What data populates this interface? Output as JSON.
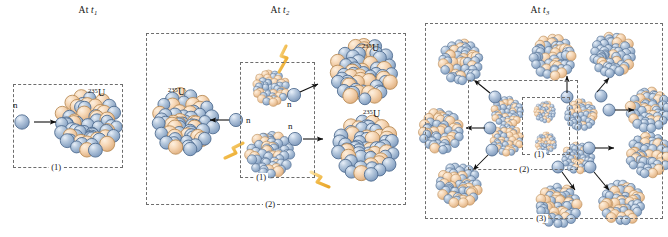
{
  "figure": {
    "width": 668,
    "height": 237,
    "background": "#ffffff"
  },
  "colors": {
    "nucleon_blue": "#a9bed9",
    "nucleon_blue_dark": "#6d88ad",
    "nucleon_peach": "#f6d7b6",
    "nucleon_peach_dark": "#d9a974",
    "neutron": "#aac0da",
    "neutron_dark": "#6f8bb0",
    "gamma": "#f0bb55",
    "gamma_light": "#f8dfa4",
    "outline": "#2b3a4d",
    "dash": "#6d6d6d",
    "arrow": "#101010",
    "text": "#141414"
  },
  "panels": [
    {
      "id": "panel-1",
      "title_prefix": "At ",
      "title_var": "t",
      "title_sub": "1",
      "boxes": [
        {
          "id": "box-1",
          "label": "(1)"
        }
      ],
      "nuclei": [
        {
          "id": "u235-p1",
          "label_sup": "235",
          "label_el": "U",
          "size": "large"
        }
      ],
      "neutrons": [
        {
          "id": "neutron-p1",
          "label": "n"
        }
      ],
      "gammas": []
    },
    {
      "id": "panel-2",
      "title_prefix": "At ",
      "title_var": "t",
      "title_sub": "2",
      "boxes": [
        {
          "id": "box-1",
          "label": "(1)"
        },
        {
          "id": "box-2",
          "label": "(2)"
        }
      ],
      "nuclei": [
        {
          "id": "u235-p2-left",
          "label_sup": "235",
          "label_el": "U",
          "size": "large"
        },
        {
          "id": "u235-p2-tr",
          "label_sup": "235",
          "label_el": "U",
          "size": "large"
        },
        {
          "id": "u235-p2-br",
          "label_sup": "235",
          "label_el": "U",
          "size": "large"
        },
        {
          "id": "frag-p2-top",
          "label_sup": "",
          "label_el": "",
          "size": "small"
        },
        {
          "id": "frag-p2-bottom",
          "label_sup": "",
          "label_el": "",
          "size": "medium"
        }
      ],
      "neutrons": [
        {
          "id": "neutron-p2-left",
          "label": "n"
        },
        {
          "id": "neutron-p2-upper",
          "label": "n"
        },
        {
          "id": "neutron-p2-lower",
          "label": "n"
        }
      ],
      "gammas": [
        {
          "id": "gamma-p2-top"
        },
        {
          "id": "gamma-p2-left"
        },
        {
          "id": "gamma-p2-bottom"
        }
      ]
    },
    {
      "id": "panel-3",
      "title_prefix": "At ",
      "title_var": "t",
      "title_sub": "3",
      "boxes": [
        {
          "id": "box-1",
          "label": "(1)"
        },
        {
          "id": "box-2",
          "label": "(2)"
        },
        {
          "id": "box-3",
          "label": "(3)"
        }
      ],
      "nuclei": [
        {
          "id": "u235-p3-a",
          "size": "large"
        },
        {
          "id": "u235-p3-b",
          "size": "large"
        },
        {
          "id": "u235-p3-c",
          "size": "large"
        },
        {
          "id": "u235-p3-d",
          "size": "large"
        },
        {
          "id": "u235-p3-e",
          "size": "large"
        },
        {
          "id": "u235-p3-f",
          "size": "large"
        },
        {
          "id": "u235-p3-g",
          "size": "large"
        },
        {
          "id": "u235-p3-h",
          "size": "large"
        },
        {
          "id": "u235-p3-i",
          "size": "large"
        },
        {
          "id": "frag-p3-a",
          "size": "medium"
        },
        {
          "id": "frag-p3-b",
          "size": "medium"
        },
        {
          "id": "frag-p3-c",
          "size": "medium"
        },
        {
          "id": "frag-p3-d",
          "size": "small"
        },
        {
          "id": "frag-p3-e",
          "size": "small"
        }
      ],
      "neutrons": [
        {
          "id": "neutron-p3-1"
        },
        {
          "id": "neutron-p3-2"
        },
        {
          "id": "neutron-p3-3"
        },
        {
          "id": "neutron-p3-4"
        },
        {
          "id": "neutron-p3-5"
        },
        {
          "id": "neutron-p3-6"
        },
        {
          "id": "neutron-p3-7"
        },
        {
          "id": "neutron-p3-8"
        },
        {
          "id": "neutron-p3-9"
        }
      ],
      "gammas": []
    }
  ],
  "labels": {
    "at": "At",
    "t": "t",
    "t1_sub": "1",
    "t2_sub": "2",
    "t3_sub": "3",
    "u_sup": "235",
    "u_symbol": "U",
    "neutron": "n",
    "gen1": "(1)",
    "gen2": "(2)",
    "gen3": "(3)"
  }
}
